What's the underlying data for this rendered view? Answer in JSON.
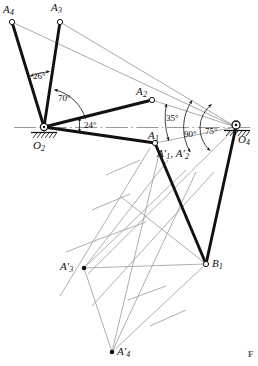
{
  "figure": {
    "kind": "kinematic-linkage-construction-diagram",
    "corner_mark": "F",
    "ground_line_label": "",
    "points": [
      {
        "id": "A4",
        "label_main": "A",
        "label_sub": "4",
        "x": 12,
        "y": 22,
        "marker": "open-circle"
      },
      {
        "id": "A3",
        "label_main": "A",
        "label_sub": "3",
        "x": 60,
        "y": 22,
        "marker": "open-circle"
      },
      {
        "id": "A2",
        "label_main": "A",
        "label_sub": "2",
        "x": 152,
        "y": 100,
        "marker": "open-circle"
      },
      {
        "id": "A1",
        "label_main": "A",
        "label_sub": "1",
        "x": 155,
        "y": 143,
        "marker": "open-circle"
      },
      {
        "id": "O2",
        "label_main": "O",
        "label_sub": "2",
        "x": 44,
        "y": 127,
        "marker": "pivot-ground"
      },
      {
        "id": "O4",
        "label_main": "O",
        "label_sub": "4",
        "x": 236,
        "y": 127,
        "marker": "pivot-ground"
      },
      {
        "id": "B1",
        "label_main": "B",
        "label_sub": "1",
        "x": 206,
        "y": 264,
        "marker": "open-circle"
      },
      {
        "id": "A3p",
        "label_main": "A",
        "label_sub": "3",
        "x": 84,
        "y": 268,
        "marker": "filled-dot",
        "prime": true
      },
      {
        "id": "A4p",
        "label_main": "A",
        "label_sub": "4",
        "x": 112,
        "y": 352,
        "marker": "filled-dot",
        "prime": true
      }
    ],
    "point_labels": [
      {
        "name": "label-A4",
        "text_main": "A",
        "text_sub": "4",
        "prime": false,
        "x": 3,
        "y": 4
      },
      {
        "name": "label-A3",
        "text_main": "A",
        "text_sub": "3",
        "prime": false,
        "x": 51,
        "y": 2
      },
      {
        "name": "label-A2",
        "text_main": "A",
        "text_sub": "2",
        "prime": false,
        "x": 136,
        "y": 86
      },
      {
        "name": "label-A1",
        "text_main": "A",
        "text_sub": "1",
        "prime": false,
        "x": 148,
        "y": 130
      },
      {
        "name": "label-O2",
        "text_main": "O",
        "text_sub": "2",
        "prime": false,
        "x": 33,
        "y": 140
      },
      {
        "name": "label-O4",
        "text_main": "O",
        "text_sub": "4",
        "prime": false,
        "x": 238,
        "y": 134
      },
      {
        "name": "label-B1",
        "text_main": "B",
        "text_sub": "1",
        "prime": false,
        "x": 212,
        "y": 258
      },
      {
        "name": "label-A3-prime",
        "text_main": "A",
        "text_sub": "3",
        "prime": true,
        "x": 60,
        "y": 261
      },
      {
        "name": "label-A4-prime",
        "text_main": "A",
        "text_sub": "4",
        "prime": true,
        "x": 117,
        "y": 346
      }
    ],
    "combined_label": {
      "name": "label-A1-A2-prime",
      "text": "A′1, A′2",
      "parts": [
        {
          "main": "A",
          "sub": "1",
          "prime": true,
          "trail": ","
        },
        {
          "main": "A",
          "sub": "2",
          "prime": true,
          "trail": ""
        }
      ],
      "x": 157,
      "y": 148
    },
    "angles": [
      {
        "name": "angle-26",
        "text": "26°",
        "x": 33,
        "y": 72,
        "vertex": "O2"
      },
      {
        "name": "angle-70",
        "text": "70°",
        "x": 58,
        "y": 94,
        "vertex": "O2"
      },
      {
        "name": "angle-24",
        "text": "24°",
        "x": 84,
        "y": 122,
        "vertex": "O2"
      },
      {
        "name": "angle-35",
        "text": "35°",
        "x": 167,
        "y": 115,
        "vertex": "O4"
      },
      {
        "name": "angle-90",
        "text": "90°",
        "x": 185,
        "y": 130,
        "vertex": "O4"
      },
      {
        "name": "angle-75",
        "text": "75°",
        "x": 206,
        "y": 127,
        "vertex": "O4"
      }
    ],
    "links": [
      {
        "name": "link-O2-A4",
        "from": "O2",
        "to": "A4",
        "style": "thick"
      },
      {
        "name": "link-O2-A3",
        "from": "O2",
        "to": "A3",
        "style": "thick"
      },
      {
        "name": "link-O2-A2",
        "from": "O2",
        "to": "A2",
        "style": "thick"
      },
      {
        "name": "link-O2-A1",
        "from": "O2",
        "to": "A1",
        "style": "thick"
      },
      {
        "name": "link-A1-B1",
        "from": "A1",
        "to": "B1",
        "style": "thick"
      },
      {
        "name": "link-O4-B1",
        "from": "O4",
        "to": "B1",
        "style": "thick"
      }
    ],
    "colors": {
      "link": "#111111",
      "construction": "#9a9a9a",
      "centerline": "#8d8d8d",
      "text": "#111111",
      "ground_hatch": "#222222"
    }
  }
}
